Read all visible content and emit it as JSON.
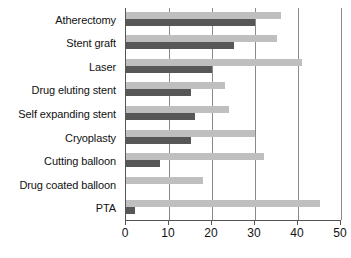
{
  "chart_data": {
    "type": "bar",
    "orientation": "horizontal",
    "title": "",
    "subtitle": "",
    "xlabel": "",
    "ylabel": "",
    "xlim": [
      0,
      50
    ],
    "ylim": null,
    "grid": true,
    "legend": null,
    "legend_position": "none",
    "xticks": [
      0,
      10,
      20,
      30,
      40,
      50
    ],
    "xtick_labels": [
      "0",
      "10",
      "20",
      "30",
      "40",
      "50"
    ],
    "categories": [
      "Atherectomy",
      "Stent graft",
      "Laser",
      "Drug eluting stent",
      "Self expanding stent",
      "Cryoplasty",
      "Cutting balloon",
      "Drug coated balloon",
      "PTA"
    ],
    "series": [
      {
        "name": "light",
        "color": "#bfbfbf",
        "values": [
          36,
          35,
          41,
          23,
          24,
          30,
          32,
          18,
          45
        ]
      },
      {
        "name": "dark",
        "color": "#575757",
        "values": [
          30,
          25,
          20,
          15,
          16,
          15,
          8,
          0,
          2
        ]
      }
    ],
    "annotations": []
  },
  "axis": {
    "frame_color": "#555555",
    "gridline_color": "#8a8a8a"
  }
}
